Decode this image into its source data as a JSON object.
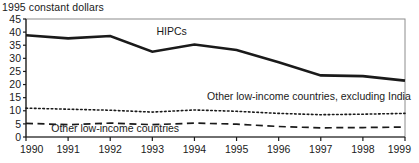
{
  "chart_data": {
    "type": "line",
    "title": "1995 constant dollars",
    "xlabel": "",
    "ylabel": "",
    "x": [
      1990,
      1991,
      1992,
      1993,
      1994,
      1995,
      1996,
      1997,
      1998,
      1999
    ],
    "xtick_labels": [
      "1990",
      "1991",
      "1992",
      "1993",
      "1994",
      "1995",
      "1996",
      "1997",
      "1998",
      "1999"
    ],
    "ytick_labels": [
      "0",
      "5",
      "10",
      "15",
      "20",
      "25",
      "30",
      "35",
      "40",
      "45"
    ],
    "yticks": [
      0,
      5,
      10,
      15,
      20,
      25,
      30,
      35,
      40,
      45
    ],
    "ylim": [
      0,
      45
    ],
    "xlim": [
      1990,
      1999
    ],
    "grid": false,
    "legend": "inline-annotations",
    "series": [
      {
        "name": "HIPCs",
        "style": "solid",
        "color": "#1a1a1a",
        "width": 2.6,
        "values": [
          38.8,
          37.6,
          38.5,
          32.5,
          35.3,
          33.2,
          28.5,
          23.5,
          23.2,
          21.5
        ],
        "label": "HIPCs",
        "label_x": 1993.1,
        "label_y": 39.0
      },
      {
        "name": "Other low-income countries, excluding India",
        "style": "dotted",
        "color": "#1a1a1a",
        "width": 1.6,
        "values": [
          11.0,
          10.6,
          10.2,
          9.5,
          10.3,
          9.8,
          9.0,
          8.5,
          8.7,
          9.0
        ],
        "label": "Other low-income countries, excluding India",
        "label_x": 1994.3,
        "label_y": 14.2
      },
      {
        "name": "Other low-income countries",
        "style": "dashed",
        "color": "#1a1a1a",
        "width": 1.7,
        "values": [
          5.2,
          4.7,
          5.3,
          4.7,
          5.3,
          4.9,
          4.0,
          3.5,
          3.6,
          3.8
        ],
        "label": "Other low-income countries",
        "label_x": 1990.6,
        "label_y": 1.9
      }
    ]
  },
  "axes": {
    "frame_color": "#8c8c8c",
    "axis_color": "#1a1a1a"
  }
}
